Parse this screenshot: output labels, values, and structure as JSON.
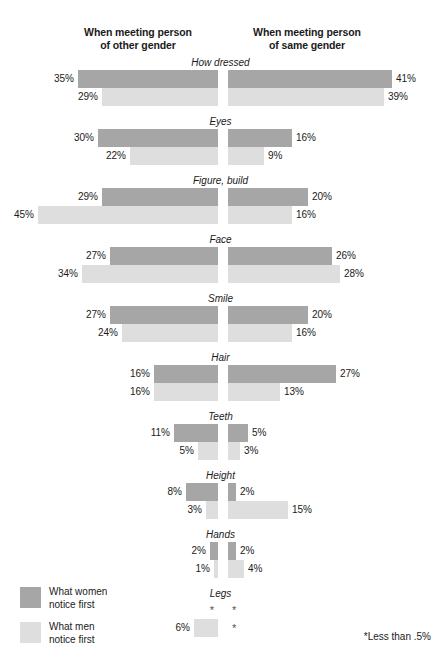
{
  "header": {
    "left_title_line1": "When meeting person",
    "left_title_line2": "of other gender",
    "right_title_line1": "When meeting person",
    "right_title_line2": "of same gender"
  },
  "legend": {
    "items": [
      {
        "label_line1": "What women",
        "label_line2": "notice first",
        "color": "#a6a6a6",
        "series": "women"
      },
      {
        "label_line1": "What men",
        "label_line2": "notice first",
        "color": "#dedede",
        "series": "men"
      }
    ]
  },
  "footnote": "*Less than .5%",
  "chart_data": {
    "type": "bar",
    "title": "",
    "subtitle": "",
    "orientation": "horizontal-diverging",
    "xlabel": "",
    "ylabel": "",
    "grid": false,
    "legend_position": "bottom-left",
    "axis_note": "Bars radiate outward from a central axis; left half = when meeting person of other gender, right half = when meeting person of same gender. Scale approx. 4 px per percent.",
    "footnote": "*Less than .5%",
    "panels": [
      {
        "name": "other_gender",
        "header": "When meeting person of other gender"
      },
      {
        "name": "same_gender",
        "header": "When meeting person of same gender"
      }
    ],
    "series": [
      {
        "name": "What women notice first",
        "key": "women",
        "color": "#a6a6a6"
      },
      {
        "name": "What men notice first",
        "key": "men",
        "color": "#dedede"
      }
    ],
    "categories": [
      "How dressed",
      "Eyes",
      "Figure, build",
      "Face",
      "Smile",
      "Hair",
      "Teeth",
      "Height",
      "Hands",
      "Legs"
    ],
    "rows": [
      {
        "category": "How dressed",
        "other_gender": {
          "women": 35,
          "men": 29
        },
        "same_gender": {
          "women": 41,
          "men": 39
        },
        "labels": {
          "other_women": "35%",
          "other_men": "29%",
          "same_women": "41%",
          "same_men": "39%"
        }
      },
      {
        "category": "Eyes",
        "other_gender": {
          "women": 30,
          "men": 22
        },
        "same_gender": {
          "women": 16,
          "men": 9
        },
        "labels": {
          "other_women": "30%",
          "other_men": "22%",
          "same_women": "16%",
          "same_men": "9%"
        }
      },
      {
        "category": "Figure, build",
        "other_gender": {
          "women": 29,
          "men": 45
        },
        "same_gender": {
          "women": 20,
          "men": 16
        },
        "labels": {
          "other_women": "29%",
          "other_men": "45%",
          "same_women": "20%",
          "same_men": "16%"
        }
      },
      {
        "category": "Face",
        "other_gender": {
          "women": 27,
          "men": 34
        },
        "same_gender": {
          "women": 26,
          "men": 28
        },
        "labels": {
          "other_women": "27%",
          "other_men": "34%",
          "same_women": "26%",
          "same_men": "28%"
        }
      },
      {
        "category": "Smile",
        "other_gender": {
          "women": 27,
          "men": 24
        },
        "same_gender": {
          "women": 20,
          "men": 16
        },
        "labels": {
          "other_women": "27%",
          "other_men": "24%",
          "same_women": "20%",
          "same_men": "16%"
        }
      },
      {
        "category": "Hair",
        "other_gender": {
          "women": 16,
          "men": 16
        },
        "same_gender": {
          "women": 27,
          "men": 13
        },
        "labels": {
          "other_women": "16%",
          "other_men": "16%",
          "same_women": "27%",
          "same_men": "13%"
        }
      },
      {
        "category": "Teeth",
        "other_gender": {
          "women": 11,
          "men": 5
        },
        "same_gender": {
          "women": 5,
          "men": 3
        },
        "labels": {
          "other_women": "11%",
          "other_men": "5%",
          "same_women": "5%",
          "same_men": "3%"
        }
      },
      {
        "category": "Height",
        "other_gender": {
          "women": 8,
          "men": 3
        },
        "same_gender": {
          "women": 2,
          "men": 15
        },
        "labels": {
          "other_women": "8%",
          "other_men": "3%",
          "same_women": "2%",
          "same_men": "15%"
        }
      },
      {
        "category": "Hands",
        "other_gender": {
          "women": 2,
          "men": 1
        },
        "same_gender": {
          "women": 2,
          "men": 4
        },
        "labels": {
          "other_women": "2%",
          "other_men": "1%",
          "same_women": "2%",
          "same_men": "4%"
        }
      },
      {
        "category": "Legs",
        "other_gender": {
          "women": 0,
          "men": 6
        },
        "same_gender": {
          "women": 0,
          "men": 0
        },
        "labels": {
          "other_women": "*",
          "other_men": "6%",
          "same_women": "*",
          "same_men": "*"
        }
      }
    ]
  }
}
